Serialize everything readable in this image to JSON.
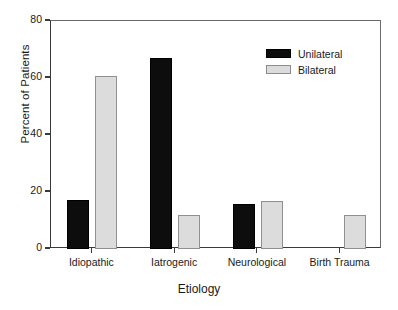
{
  "chart_data": {
    "type": "bar",
    "title": "",
    "xlabel": "Etiology",
    "ylabel": "Percent of Patients",
    "categories": [
      "Idiopathic",
      "Iatrogenic",
      "Neurological",
      "Birth Trauma"
    ],
    "series": [
      {
        "name": "Unilateral",
        "color": "#000000",
        "values": [
          17.2,
          67.0,
          15.8,
          0
        ]
      },
      {
        "name": "Bilateral",
        "color": "#dcdcdc",
        "values": [
          60.7,
          12.0,
          16.8,
          12.0
        ]
      }
    ],
    "ylim": [
      0,
      80
    ],
    "yticks": [
      0,
      20,
      40,
      60,
      80
    ],
    "ytick_labels": [
      "0",
      "20",
      "40",
      "60",
      "80"
    ],
    "grid": false,
    "legend_position": "top-right",
    "legend": [
      "Unilateral",
      "Bilateral"
    ]
  },
  "axes": {
    "y_title": "Percent of Patients",
    "x_title": "Etiology"
  }
}
